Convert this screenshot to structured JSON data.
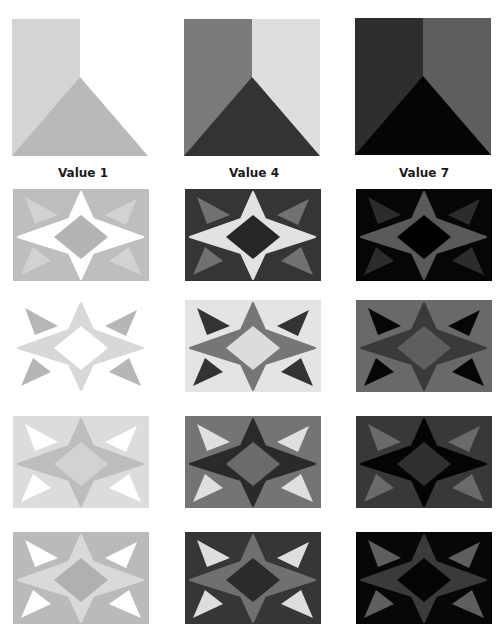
{
  "columns": [
    {
      "label": "Value 1",
      "square": {
        "left": "#d4d4d4",
        "right": "#ffffff",
        "bottom": "#b9b9b9"
      }
    },
    {
      "label": "Value 4",
      "square": {
        "left": "#7a7a7a",
        "right": "#dedede",
        "bottom": "#333333"
      }
    },
    {
      "label": "Value 7",
      "square": {
        "left": "#2e2e2e",
        "right": "#5e5e5e",
        "bottom": "#050505"
      }
    }
  ],
  "rows": [
    [
      {
        "bg": "#bebebe",
        "star": "#ffffff",
        "diamond": "#b4b4b4",
        "triangles": "#d2d2d2"
      },
      {
        "bg": "#353535",
        "star": "#e2e2e2",
        "diamond": "#262626",
        "triangles": "#717171"
      },
      {
        "bg": "#060606",
        "star": "#5a5a5a",
        "diamond": "#000000",
        "triangles": "#2c2c2c"
      }
    ],
    [
      {
        "bg": "#ffffff",
        "star": "#d8d8d8",
        "diamond": "#ffffff",
        "triangles": "#b6b6b6"
      },
      {
        "bg": "#e4e4e4",
        "star": "#767676",
        "diamond": "#dcdcdc",
        "triangles": "#333333"
      },
      {
        "bg": "#696969",
        "star": "#3a3a3a",
        "diamond": "#5e5e5e",
        "triangles": "#060606"
      }
    ],
    [
      {
        "bg": "#dcdcdc",
        "star": "#bdbdbd",
        "diamond": "#d2d2d2",
        "triangles": "#ffffff"
      },
      {
        "bg": "#747474",
        "star": "#2a2a2a",
        "diamond": "#6b6b6b",
        "triangles": "#dfdfdf"
      },
      {
        "bg": "#383838",
        "star": "#040404",
        "diamond": "#2f2f2f",
        "triangles": "#6a6a6a"
      }
    ],
    [
      {
        "bg": "#bababa",
        "star": "#d9d9d9",
        "diamond": "#b0b0b0",
        "triangles": "#ffffff"
      },
      {
        "bg": "#363636",
        "star": "#707070",
        "diamond": "#2b2b2b",
        "triangles": "#dedede"
      },
      {
        "bg": "#070707",
        "star": "#3a3a3a",
        "diamond": "#050505",
        "triangles": "#5e5e5e"
      }
    ]
  ]
}
